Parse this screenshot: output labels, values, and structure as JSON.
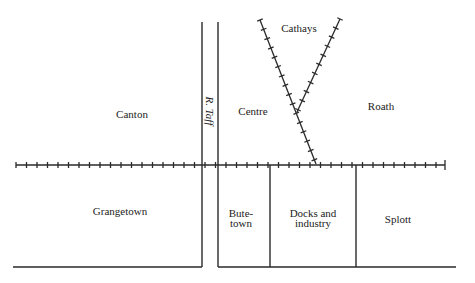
{
  "map": {
    "line_color": "#2a2a2a",
    "districts": [
      {
        "id": "canton",
        "label": "Canton",
        "x": 132,
        "y": 114
      },
      {
        "id": "centre",
        "label": "Centre",
        "x": 253,
        "y": 111
      },
      {
        "id": "cathays",
        "label": "Cathays",
        "x": 299,
        "y": 28
      },
      {
        "id": "roath",
        "label": "Roath",
        "x": 381,
        "y": 106
      },
      {
        "id": "grangetown",
        "label": "Grangetown",
        "x": 120,
        "y": 211
      },
      {
        "id": "butetown",
        "label": "Bute-\ntown",
        "line1": "Bute-",
        "line2": "town",
        "x": 241,
        "y": 218
      },
      {
        "id": "docks",
        "label": "Docks and\nindustry",
        "line1": "Docks and",
        "line2": "industry",
        "x": 313,
        "y": 218
      },
      {
        "id": "splott",
        "label": "Splott",
        "x": 398,
        "y": 219
      }
    ],
    "river": {
      "label": "R. Taff"
    }
  }
}
